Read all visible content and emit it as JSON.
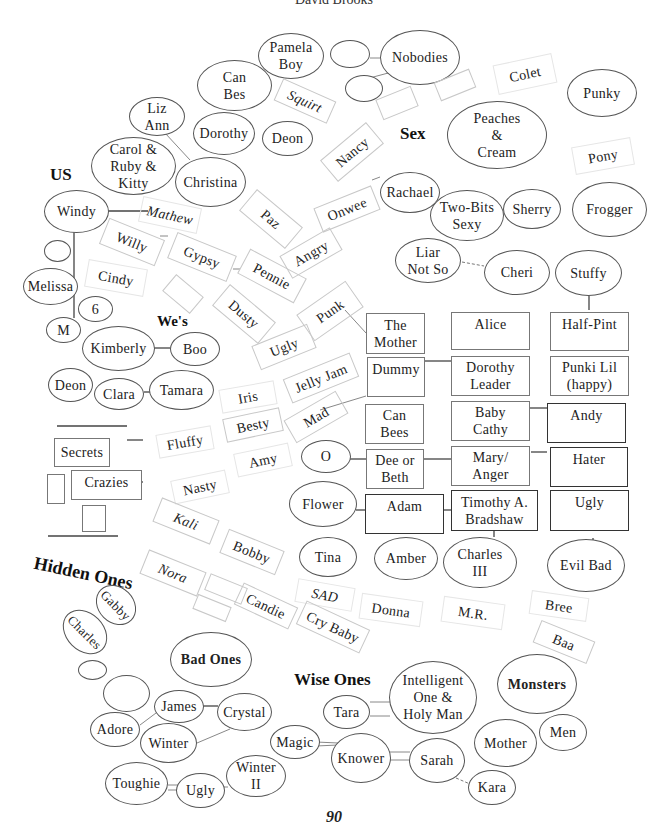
{
  "header": {
    "author": "David Brooks"
  },
  "page_number": "90",
  "groups": {
    "us": "US",
    "wes": "We's",
    "sex": "Sex",
    "hidden_ones": "Hidden Ones",
    "bad_ones": "Bad Ones",
    "wise_ones": "Wise Ones",
    "monsters": "Monsters"
  },
  "ovals": {
    "pamela_boy": "Pamela\nBoy",
    "can_bes": "Can\nBes",
    "nobodies": "Nobodies",
    "liz_ann": "Liz\nAnn",
    "dorothy": "Dorothy",
    "deon_top": "Deon",
    "carol_ruby_kitty": "Carol &\nRuby &\nKitty",
    "christina": "Christina",
    "punky": "Punky",
    "peaches_cream": "Peaches\n&\nCream",
    "windy": "Windy",
    "melissa": "Melissa",
    "six": "6",
    "m": "M",
    "kimberly": "Kimberly",
    "boo": "Boo",
    "deon": "Deon",
    "clara": "Clara",
    "tamara": "Tamara",
    "rachael": "Rachael",
    "two_bits_sexy": "Two-Bits\nSexy",
    "sherry": "Sherry",
    "frogger": "Frogger",
    "liar_not_so": "Liar\nNot So",
    "cheri": "Cheri",
    "stuffy": "Stuffy",
    "o": "O",
    "flower": "Flower",
    "tina": "Tina",
    "amber": "Amber",
    "charles_iii": "Charles\nIII",
    "evil_bad": "Evil Bad",
    "gabby": "Gabby",
    "charles": "Charles",
    "james": "James",
    "crystal": "Crystal",
    "adore": "Adore",
    "winter": "Winter",
    "toughie": "Toughie",
    "ugly_bottom": "Ugly",
    "winter_ii": "Winter\nII",
    "intelligent_one": "Intelligent\nOne &\nHoly Man",
    "tara": "Tara",
    "magic": "Magic",
    "knower": "Knower",
    "sarah": "Sarah",
    "kara": "Kara",
    "mother": "Mother",
    "men": "Men"
  },
  "boxes": {
    "the_mother": "The\nMother",
    "alice": "Alice",
    "half_pint": "Half-Pint",
    "dummy": "Dummy",
    "dorothy_leader": "Dorothy\nLeader",
    "punki_lil": "Punki Lil\n(happy)",
    "can_bees": "Can\nBees",
    "baby_cathy": "Baby\nCathy",
    "andy": "Andy",
    "dee_or_beth": "Dee or\nBeth",
    "mary_anger": "Mary/\nAnger",
    "hater": "Hater",
    "adam": "Adam",
    "timothy": "Timothy A.\nBradshaw",
    "ugly_box": "Ugly",
    "secrets": "Secrets",
    "crazies": "Crazies"
  },
  "tilted": {
    "squirt": "Squirt",
    "colet": "Colet",
    "pony": "Pony",
    "nancy": "Nancy",
    "mathew": "Mathew",
    "paz": "Paz",
    "onwee": "Onwee",
    "willy": "Willy",
    "gypsy": "Gypsy",
    "pennie": "Pennie",
    "angry": "Angry",
    "cindy": "Cindy",
    "dusty": "Dusty",
    "punk": "Punk",
    "ugly_tilt": "Ugly",
    "jelly_jam": "Jelly Jam",
    "iris": "Iris",
    "besty": "Besty",
    "mad": "Mad",
    "fluffy": "Fluffy",
    "amy": "Amy",
    "nasty": "Nasty",
    "kali": "Kali",
    "bobby": "Bobby",
    "nora": "Nora",
    "sad": "SAD",
    "candie": "Candie",
    "cry_baby": "Cry Baby",
    "donna": "Donna",
    "mr": "M.R.",
    "bree": "Bree",
    "baa": "Baa"
  }
}
